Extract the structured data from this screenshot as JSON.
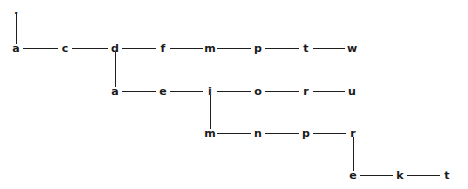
{
  "diagram": {
    "type": "letter-chain-graph",
    "width": 468,
    "height": 189,
    "background_color": "#ffffff",
    "stroke_color": "#1f1f1f",
    "text_color": "#1a1a1a",
    "rows": [
      {
        "id": "row-0",
        "y": 10,
        "nodes": [
          {
            "id": "n-root",
            "label": ".",
            "x": 16,
            "is_dot": true
          }
        ]
      },
      {
        "id": "row-1",
        "y": 48,
        "nodes": [
          {
            "id": "n-1-0",
            "label": "a",
            "x": 16
          },
          {
            "id": "n-1-1",
            "label": "c",
            "x": 65
          },
          {
            "id": "n-1-2",
            "label": "d",
            "x": 115
          },
          {
            "id": "n-1-3",
            "label": "f",
            "x": 163
          },
          {
            "id": "n-1-4",
            "label": "m",
            "x": 210
          },
          {
            "id": "n-1-5",
            "label": "p",
            "x": 258
          },
          {
            "id": "n-1-6",
            "label": "t",
            "x": 306
          },
          {
            "id": "n-1-7",
            "label": "w",
            "x": 352
          }
        ]
      },
      {
        "id": "row-2",
        "y": 91,
        "nodes": [
          {
            "id": "n-2-0",
            "label": "a",
            "x": 115
          },
          {
            "id": "n-2-1",
            "label": "e",
            "x": 163
          },
          {
            "id": "n-2-2",
            "label": "i",
            "x": 210
          },
          {
            "id": "n-2-3",
            "label": "o",
            "x": 258
          },
          {
            "id": "n-2-4",
            "label": "r",
            "x": 306
          },
          {
            "id": "n-2-5",
            "label": "u",
            "x": 352
          }
        ]
      },
      {
        "id": "row-3",
        "y": 133,
        "nodes": [
          {
            "id": "n-3-0",
            "label": "m",
            "x": 210
          },
          {
            "id": "n-3-1",
            "label": "n",
            "x": 258
          },
          {
            "id": "n-3-2",
            "label": "p",
            "x": 306
          },
          {
            "id": "n-3-3",
            "label": "r",
            "x": 353
          }
        ]
      },
      {
        "id": "row-4",
        "y": 175,
        "nodes": [
          {
            "id": "n-4-0",
            "label": "e",
            "x": 353
          },
          {
            "id": "n-4-1",
            "label": "k",
            "x": 400
          },
          {
            "id": "n-4-2",
            "label": "t",
            "x": 447
          }
        ]
      }
    ],
    "horizontal_edges": [
      {
        "id": "h-1-0",
        "y": 48,
        "x1": 16,
        "x2": 65
      },
      {
        "id": "h-1-1",
        "y": 48,
        "x1": 65,
        "x2": 115
      },
      {
        "id": "h-1-2",
        "y": 48,
        "x1": 115,
        "x2": 163
      },
      {
        "id": "h-1-3",
        "y": 48,
        "x1": 163,
        "x2": 210
      },
      {
        "id": "h-1-4",
        "y": 48,
        "x1": 210,
        "x2": 258
      },
      {
        "id": "h-1-5",
        "y": 48,
        "x1": 258,
        "x2": 306
      },
      {
        "id": "h-1-6",
        "y": 48,
        "x1": 306,
        "x2": 352
      },
      {
        "id": "h-2-0",
        "y": 91,
        "x1": 115,
        "x2": 163
      },
      {
        "id": "h-2-1",
        "y": 91,
        "x1": 163,
        "x2": 210
      },
      {
        "id": "h-2-2",
        "y": 91,
        "x1": 210,
        "x2": 258
      },
      {
        "id": "h-2-3",
        "y": 91,
        "x1": 258,
        "x2": 306
      },
      {
        "id": "h-2-4",
        "y": 91,
        "x1": 306,
        "x2": 352
      },
      {
        "id": "h-3-0",
        "y": 133,
        "x1": 210,
        "x2": 258
      },
      {
        "id": "h-3-1",
        "y": 133,
        "x1": 258,
        "x2": 306
      },
      {
        "id": "h-3-2",
        "y": 133,
        "x1": 306,
        "x2": 353
      },
      {
        "id": "h-4-0",
        "y": 175,
        "x1": 353,
        "x2": 400
      },
      {
        "id": "h-4-1",
        "y": 175,
        "x1": 400,
        "x2": 447
      }
    ],
    "vertical_edges": [
      {
        "id": "v-root-a",
        "x": 16,
        "y1": 14,
        "y2": 44
      },
      {
        "id": "v-d-a",
        "x": 115,
        "y1": 52,
        "y2": 87
      },
      {
        "id": "v-i-m",
        "x": 210,
        "y1": 95,
        "y2": 129
      },
      {
        "id": "v-r-e",
        "x": 353,
        "y1": 137,
        "y2": 171
      }
    ]
  }
}
